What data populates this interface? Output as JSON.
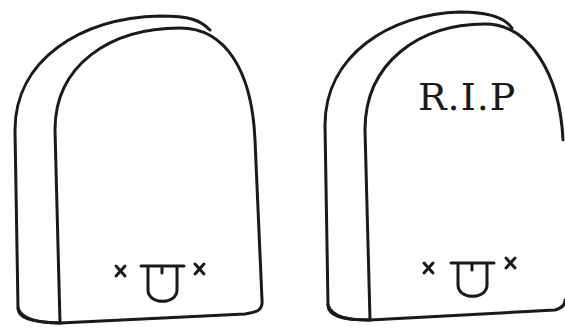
{
  "illustration": {
    "description": "Two cartoon tombstones with dead faces",
    "stroke_color": "#1a1a1a",
    "background": "#ffffff",
    "tombstones": [
      {
        "name": "tombstone-left",
        "engraving": "",
        "face": "x_x tongue out"
      },
      {
        "name": "tombstone-right",
        "engraving": "R.I.P",
        "face": "x_x tongue out"
      }
    ]
  }
}
